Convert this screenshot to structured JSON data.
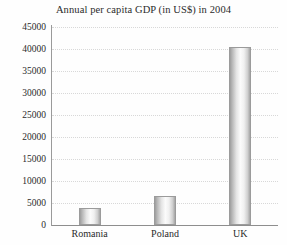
{
  "chart_data": {
    "type": "bar",
    "title": "Annual per capita GDP (in US$) in 2004",
    "xlabel": "",
    "ylabel": "",
    "categories": [
      "Romania",
      "Poland",
      "UK"
    ],
    "values": [
      3800,
      6500,
      40500
    ],
    "ylim": [
      0,
      45000
    ],
    "yticks": [
      0,
      5000,
      10000,
      15000,
      20000,
      25000,
      30000,
      35000,
      40000,
      45000
    ],
    "ytick_labels": [
      "0",
      "5000",
      "10000",
      "15000",
      "20000",
      "25000",
      "30000",
      "35000",
      "40000",
      "45000"
    ],
    "grid": true,
    "legend": false,
    "legend_position": "none",
    "series": [
      {
        "name": "Annual per capita GDP",
        "values": [
          3800,
          6500,
          40500
        ]
      }
    ]
  },
  "style": {
    "background_color": "#fefefe",
    "text_color": "#2b2b2b",
    "axis_color": "#9a9a9a",
    "baseline_color": "#8e8e8e",
    "gridline_color": "#d8d8d8",
    "bar_edge_color": "#9b9b9b",
    "bar_highlight_color": "#fbfbfb",
    "bar_shadow_color": "#9d9d9d"
  }
}
